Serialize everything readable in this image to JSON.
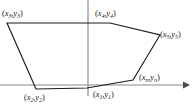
{
  "figure": {
    "kind": "polygon-vertex-diagram",
    "background_color": "#ffffff",
    "stroke_color": "#1b1b1b",
    "axis_color": "#8a8a8a",
    "axes": {
      "x_axis": {
        "name": "x-axis",
        "y_position": 85,
        "x_start": 0,
        "x_end": 186,
        "has_arrowhead": true,
        "arrow_direction": "right"
      },
      "y_axis": {
        "name": "y-axis",
        "x_position": 88,
        "y_start": 0,
        "y_end": 96,
        "has_arrowhead": false
      }
    },
    "polygon": {
      "closed": true,
      "points_px": [
        [
          7,
          23
        ],
        [
          110,
          23
        ],
        [
          160,
          35
        ],
        [
          133,
          80
        ],
        [
          87,
          88
        ],
        [
          36,
          89
        ]
      ]
    },
    "vertices": [
      {
        "id": "v1",
        "label_x": "x",
        "label_sub": "1",
        "label_y": "y",
        "label_text": "(x1,y1)",
        "point_px": [
          87,
          88
        ],
        "label_px": [
          93,
          90
        ]
      },
      {
        "id": "v2",
        "label_x": "x",
        "label_sub": "2",
        "label_y": "y",
        "label_text": "(x2,y2)",
        "point_px": [
          36,
          89
        ],
        "label_px": [
          24,
          93
        ]
      },
      {
        "id": "v3",
        "label_x": "x",
        "label_sub": "3",
        "label_y": "y",
        "label_text": "(x3,y3)",
        "point_px": [
          7,
          23
        ],
        "label_px": [
          2,
          9
        ]
      },
      {
        "id": "v4",
        "label_x": "x",
        "label_sub": "4",
        "label_y": "y",
        "label_text": "(x4,y4)",
        "point_px": [
          110,
          23
        ],
        "label_px": [
          95,
          9
        ]
      },
      {
        "id": "v5",
        "label_x": "x",
        "label_sub": "5",
        "label_y": "y",
        "label_text": "(x5,y5)",
        "point_px": [
          160,
          35
        ],
        "label_px": [
          160,
          30
        ]
      },
      {
        "id": "vn",
        "label_x": "x",
        "label_sub": "n",
        "label_y": "y",
        "label_text": "(xn,yn)",
        "point_px": [
          133,
          80
        ],
        "label_px": [
          139,
          73
        ]
      }
    ]
  }
}
